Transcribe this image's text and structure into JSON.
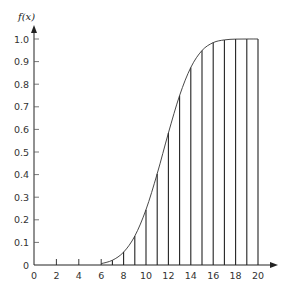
{
  "chart_data": {
    "type": "line",
    "subtype": "cdf-with-vertical-stems",
    "title": "",
    "xlabel": "",
    "ylabel": "f(x)",
    "xlim": [
      0,
      20
    ],
    "ylim": [
      0,
      1.0
    ],
    "x_ticks": [
      0,
      2,
      4,
      6,
      8,
      10,
      12,
      14,
      16,
      18,
      20
    ],
    "x_tick_labels": [
      "0",
      "2",
      "4",
      "6",
      "8",
      "10",
      "12",
      "14",
      "16",
      "18",
      "20"
    ],
    "y_ticks": [
      0,
      0.1,
      0.2,
      0.3,
      0.4,
      0.5,
      0.6,
      0.7,
      0.8,
      0.9,
      1.0
    ],
    "y_tick_labels": [
      "0",
      "0.1",
      "0.2",
      "0.3",
      "0.4",
      "0.5",
      "0.6",
      "0.7",
      "0.8",
      "0.9",
      "1.0"
    ],
    "grid": false,
    "legend": null,
    "x": [
      0,
      1,
      2,
      3,
      4,
      5,
      6,
      7,
      8,
      9,
      10,
      11,
      12,
      13,
      14,
      15,
      16,
      17,
      18,
      19,
      20
    ],
    "values": [
      0,
      0,
      0,
      0,
      0,
      0,
      0.006,
      0.021,
      0.057,
      0.128,
      0.245,
      0.404,
      0.584,
      0.75,
      0.874,
      0.949,
      0.984,
      0.996,
      0.9995,
      1.0,
      1.0
    ],
    "stems_from_x": 7,
    "small_ticks_on_axis_at": [
      2,
      4,
      6
    ]
  },
  "layout": {
    "origin_px": [
      34,
      265
    ],
    "x_px_per_unit": 11.2,
    "y_px_per_unit": 226,
    "line_color": "#222222"
  }
}
